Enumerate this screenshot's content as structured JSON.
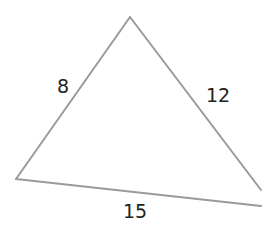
{
  "diagram": {
    "type": "triangle",
    "stroke_color": "#9a9a9a",
    "label_color": "#222222",
    "vertices": {
      "apex": [
        130,
        17
      ],
      "bottom_left": [
        16,
        179
      ],
      "right_upper_end": [
        261,
        190
      ],
      "bottom_right_end": [
        261,
        206
      ]
    },
    "sides": [
      {
        "id": "left",
        "label": "8",
        "label_pos": [
          63,
          93
        ]
      },
      {
        "id": "right",
        "label": "12",
        "label_pos": [
          218,
          102
        ]
      },
      {
        "id": "bottom",
        "label": "15",
        "label_pos": [
          135,
          218
        ]
      }
    ]
  }
}
